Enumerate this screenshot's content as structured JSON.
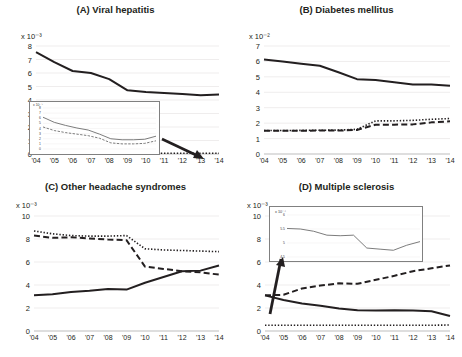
{
  "figure": {
    "title": "",
    "panels": [
      {
        "id": "A",
        "label": "(A) Viral hepatitis",
        "y_exponent": "x 10⁻³",
        "y_ticks": [
          "8",
          "7",
          "6",
          "5",
          "4",
          "3",
          "2",
          "1",
          "0"
        ],
        "has_inset": true,
        "inset": {
          "y_exponent": "x 10⁻⁵",
          "y_ticks": [
            "8",
            "7",
            "6",
            "5",
            "4",
            "3",
            "2",
            "1",
            "0"
          ]
        },
        "has_arrow": true
      },
      {
        "id": "B",
        "label": "(B) Diabetes mellitus",
        "y_exponent": "x 10⁻²",
        "y_ticks": [
          "7",
          "6",
          "5",
          "4",
          "3",
          "2",
          "1",
          "0"
        ],
        "has_inset": false,
        "has_arrow": false
      },
      {
        "id": "C",
        "label": "(C) Other headache syndromes",
        "y_exponent": "x 10⁻³",
        "y_ticks": [
          "10",
          "8",
          "6",
          "4",
          "2",
          "0"
        ],
        "has_inset": false,
        "has_arrow": false
      },
      {
        "id": "D",
        "label": "(D) Multiple sclerosis",
        "y_exponent": "x 10⁻³",
        "y_ticks": [
          "10",
          "8",
          "6",
          "4",
          "2",
          "0"
        ],
        "has_inset": true,
        "inset": {
          "y_exponent": "x 10⁻⁴",
          "y_ticks": [
            "6",
            "5.5",
            "5",
            "4.5"
          ]
        },
        "has_arrow": true
      }
    ]
  },
  "chart_data": [
    {
      "type": "line",
      "panel": "A",
      "title": "(A) Viral hepatitis",
      "xlabel": "",
      "ylabel": "x 10⁻³",
      "x": [
        "'04",
        "'05",
        "'06",
        "'07",
        "'08",
        "'09",
        "'10",
        "'11",
        "'12",
        "'13",
        "'14"
      ],
      "ylim": [
        0,
        8
      ],
      "yticks": [
        0,
        1,
        2,
        3,
        4,
        5,
        6,
        7,
        8
      ],
      "grid": true,
      "legend": "none",
      "series": [
        {
          "name": "solid",
          "style": "solid",
          "values": [
            7.55,
            6.8,
            6.15,
            6.0,
            5.55,
            4.72,
            4.6,
            4.52,
            4.45,
            4.35,
            4.4
          ]
        },
        {
          "name": "dotted-near-zero",
          "style": "dotted",
          "values": [
            0.06,
            0.06,
            0.06,
            0.06,
            0.06,
            0.06,
            0.06,
            0.06,
            0.06,
            0.06,
            0.06
          ]
        }
      ],
      "inset": {
        "type": "line",
        "ylabel": "x 10⁻⁵",
        "ylim": [
          0,
          8
        ],
        "yticks": [
          0,
          1,
          2,
          3,
          4,
          5,
          6,
          7,
          8
        ],
        "x": [
          "'04",
          "'05",
          "'06",
          "'07",
          "'08",
          "'09",
          "'10",
          "'11",
          "'12",
          "'13",
          "'14"
        ],
        "series": [
          {
            "name": "inset-solid",
            "style": "solid",
            "values": [
              6.2,
              5.2,
              4.6,
              4.1,
              3.7,
              2.9,
              2.0,
              1.8,
              1.8,
              1.9,
              2.5
            ]
          },
          {
            "name": "inset-dashed",
            "style": "dashed",
            "values": [
              4.3,
              3.6,
              3.2,
              2.9,
              2.6,
              2.1,
              1.2,
              1.0,
              1.0,
              1.1,
              1.6
            ]
          }
        ]
      }
    },
    {
      "type": "line",
      "panel": "B",
      "title": "(B) Diabetes mellitus",
      "xlabel": "",
      "ylabel": "x 10⁻²",
      "x": [
        "'04",
        "'05",
        "'06",
        "'07",
        "'08",
        "'09",
        "'10",
        "'11",
        "'12",
        "'13",
        "'14"
      ],
      "ylim": [
        0,
        7
      ],
      "yticks": [
        0,
        1,
        2,
        3,
        4,
        5,
        6,
        7
      ],
      "grid": true,
      "legend": "none",
      "series": [
        {
          "name": "solid",
          "style": "solid",
          "values": [
            6.12,
            6.0,
            5.85,
            5.72,
            5.3,
            4.85,
            4.8,
            4.65,
            4.5,
            4.5,
            4.42
          ]
        },
        {
          "name": "dotted",
          "style": "dotted",
          "values": [
            1.52,
            1.52,
            1.53,
            1.54,
            1.55,
            1.6,
            2.15,
            2.15,
            2.18,
            2.25,
            2.3
          ]
        },
        {
          "name": "dashed",
          "style": "dashed",
          "values": [
            1.5,
            1.5,
            1.5,
            1.52,
            1.52,
            1.56,
            1.9,
            1.9,
            1.92,
            2.05,
            2.12
          ]
        }
      ]
    },
    {
      "type": "line",
      "panel": "C",
      "title": "(C) Other headache syndromes",
      "xlabel": "",
      "ylabel": "x 10⁻³",
      "x": [
        "'04",
        "'05",
        "'06",
        "'07",
        "'08",
        "'09",
        "'10",
        "'11",
        "'12",
        "'13",
        "'14"
      ],
      "ylim": [
        0,
        10
      ],
      "yticks": [
        0,
        2,
        4,
        6,
        8,
        10
      ],
      "grid": true,
      "legend": "none",
      "series": [
        {
          "name": "dotted",
          "style": "dotted",
          "values": [
            8.7,
            8.45,
            8.3,
            8.25,
            8.25,
            8.3,
            7.15,
            7.05,
            7.0,
            6.95,
            6.9
          ]
        },
        {
          "name": "dashed",
          "style": "dashed",
          "values": [
            8.3,
            8.1,
            8.15,
            8.05,
            7.95,
            7.9,
            5.6,
            5.4,
            5.2,
            5.1,
            4.9
          ]
        },
        {
          "name": "solid",
          "style": "solid",
          "values": [
            3.1,
            3.2,
            3.4,
            3.5,
            3.65,
            3.6,
            4.2,
            4.7,
            5.2,
            5.25,
            5.7
          ]
        }
      ]
    },
    {
      "type": "line",
      "panel": "D",
      "title": "(D) Multiple sclerosis",
      "xlabel": "",
      "ylabel": "x 10⁻³",
      "x": [
        "'04",
        "'05",
        "'06",
        "'07",
        "'08",
        "'09",
        "'10",
        "'11",
        "'12",
        "'13",
        "'14"
      ],
      "ylim": [
        0,
        10
      ],
      "yticks": [
        0,
        2,
        4,
        6,
        8,
        10
      ],
      "grid": true,
      "legend": "none",
      "series": [
        {
          "name": "dashed",
          "style": "dashed",
          "values": [
            3.1,
            3.15,
            3.7,
            3.95,
            4.15,
            4.1,
            4.45,
            4.8,
            5.2,
            5.45,
            5.7
          ]
        },
        {
          "name": "solid",
          "style": "solid",
          "values": [
            3.1,
            2.7,
            2.4,
            2.2,
            1.95,
            1.8,
            1.78,
            1.8,
            1.78,
            1.72,
            1.3
          ]
        },
        {
          "name": "dotted",
          "style": "dotted",
          "values": [
            0.5,
            0.5,
            0.5,
            0.5,
            0.5,
            0.5,
            0.5,
            0.5,
            0.5,
            0.5,
            0.52
          ]
        }
      ],
      "inset": {
        "type": "line",
        "ylabel": "x 10⁻⁴",
        "ylim": [
          4.5,
          6
        ],
        "yticks": [
          4.5,
          5,
          5.5,
          6
        ],
        "x": [
          "'04",
          "'05",
          "'06",
          "'07",
          "'08",
          "'09",
          "'10",
          "'11",
          "'12",
          "'13",
          "'14"
        ],
        "series": [
          {
            "name": "inset-solid",
            "style": "solid",
            "values": [
              5.52,
              5.5,
              5.42,
              5.28,
              5.26,
              5.28,
              4.82,
              4.78,
              4.74,
              4.92,
              5.05
            ]
          }
        ]
      }
    }
  ]
}
